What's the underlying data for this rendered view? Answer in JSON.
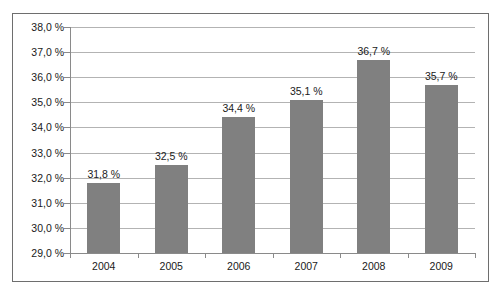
{
  "chart_data": {
    "type": "bar",
    "title": "",
    "xlabel": "",
    "ylabel": "",
    "categories": [
      "2004",
      "2005",
      "2006",
      "2007",
      "2008",
      "2009"
    ],
    "values": [
      31.8,
      32.5,
      34.4,
      35.1,
      36.7,
      35.7
    ],
    "value_labels": [
      "31,8 %",
      "32,5 %",
      "34,4 %",
      "35,1 %",
      "36,7 %",
      "35,7 %"
    ],
    "ylim": [
      29.0,
      38.0
    ],
    "ytick_step": 1.0,
    "ytick_labels": [
      "38,0 %",
      "37,0 %",
      "36,0 %",
      "35,0 %",
      "34,0 %",
      "33,0 %",
      "32,0 %",
      "31,0 %",
      "30,0 %",
      "29,0 %"
    ],
    "ytick_values": [
      38.0,
      37.0,
      36.0,
      35.0,
      34.0,
      33.0,
      32.0,
      31.0,
      30.0,
      29.0
    ],
    "grid": true,
    "legend": false,
    "legend_position": "none",
    "series": [
      {
        "name": "",
        "values": [
          31.8,
          32.5,
          34.4,
          35.1,
          36.7,
          35.7
        ]
      }
    ],
    "colors": {
      "bar": "#808080",
      "gridline": "#b3b3b3",
      "axis": "#8a8a8a",
      "frame": "#6e6e6e",
      "text": "#1a1a1a",
      "background": "#ffffff"
    }
  }
}
